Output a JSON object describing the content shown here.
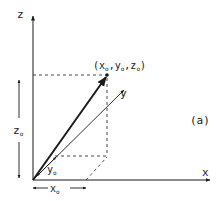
{
  "figure": {
    "panel_label": "(a)",
    "axes": {
      "x_label": "x",
      "y_label": "y",
      "z_label": "z"
    },
    "point_label": {
      "open": "(x",
      "x_sub": "o",
      "comma1": ",y",
      "y_sub": "o",
      "comma2": ",z",
      "z_sub": "o",
      "close": ")"
    },
    "dimensions": {
      "z0": "z",
      "z0_sub": "o",
      "y0": "y",
      "y0_sub": "o",
      "x0": "x",
      "x0_sub": "o"
    },
    "colors": {
      "ink": "#1a1a1a",
      "background": "#ffffff"
    }
  }
}
